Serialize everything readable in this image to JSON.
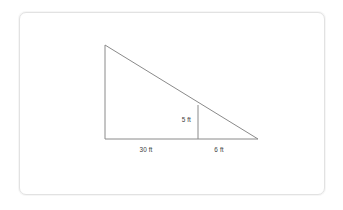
{
  "figure": {
    "name": "right-triangle-with-interior-vertical",
    "card": {
      "background_color": "#ffffff",
      "border_color": "#e2e2e2"
    },
    "stroke_color": "#8a8a8a",
    "text_color": "#3d3d3d",
    "labels": {
      "base_left": "30 ft",
      "base_right": "6 ft",
      "interior_height": "5 ft"
    },
    "geometry": {
      "apex": {
        "x": 105,
        "y": 45
      },
      "bottom_left": {
        "x": 105,
        "y": 139
      },
      "bottom_right": {
        "x": 258,
        "y": 139
      },
      "interior_foot": {
        "x": 198,
        "y": 139
      },
      "interior_top": {
        "x": 198,
        "y": 105
      }
    },
    "label_positions": {
      "base_left": {
        "x": 146,
        "y": 152
      },
      "base_right": {
        "x": 219,
        "y": 152
      },
      "interior_height": {
        "x": 191,
        "y": 122
      }
    }
  }
}
